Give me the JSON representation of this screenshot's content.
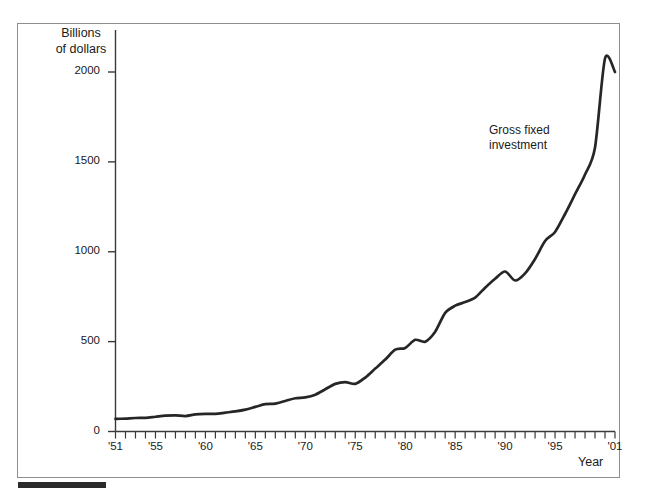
{
  "figure": {
    "ylabel": "Billions\nof dollars",
    "xlabel": "Year",
    "series_annotation": "Gross fixed\ninvestment",
    "line_color": "#262626",
    "frame_color": "#8e8e8e",
    "rule_color": "#2b2b2b"
  },
  "chart_data": {
    "type": "line",
    "title": "",
    "subtitle": "",
    "xlabel": "Year",
    "ylabel": "Billions of dollars",
    "grid": false,
    "legend_position": "inline-annotation",
    "xlim": [
      1951,
      2001
    ],
    "ylim": [
      0,
      2100
    ],
    "ytick_values": [
      0,
      500,
      1000,
      1500,
      2000
    ],
    "ytick_labels": [
      "0",
      "500",
      "1000",
      "1500",
      "2000"
    ],
    "xtick_values": [
      1951,
      1955,
      1960,
      1965,
      1970,
      1975,
      1980,
      1985,
      1990,
      1995,
      2001
    ],
    "xtick_labels": [
      "'51",
      "'55",
      "'60",
      "'65",
      "'70",
      "'75",
      "'80",
      "'85",
      "'90",
      "'95",
      "'01"
    ],
    "minor_xticks": "every year from 1951 to 2001",
    "series": [
      {
        "name": "Gross fixed investment",
        "x": [
          1951,
          1952,
          1953,
          1954,
          1955,
          1956,
          1957,
          1958,
          1959,
          1960,
          1961,
          1962,
          1963,
          1964,
          1965,
          1966,
          1967,
          1968,
          1969,
          1970,
          1971,
          1972,
          1973,
          1974,
          1975,
          1976,
          1977,
          1978,
          1979,
          1980,
          1981,
          1982,
          1983,
          1984,
          1985,
          1986,
          1987,
          1988,
          1989,
          1990,
          1991,
          1992,
          1993,
          1994,
          1995,
          1996,
          1997,
          1998,
          1999,
          2000,
          2001
        ],
        "values": [
          70,
          72,
          75,
          76,
          82,
          88,
          90,
          86,
          95,
          98,
          98,
          105,
          112,
          122,
          137,
          152,
          155,
          170,
          185,
          190,
          205,
          235,
          265,
          275,
          265,
          300,
          350,
          400,
          455,
          465,
          510,
          500,
          555,
          660,
          700,
          720,
          745,
          800,
          850,
          890,
          840,
          880,
          960,
          1060,
          1110,
          1210,
          1320,
          1430,
          1580,
          2075,
          2000
        ],
        "units": "billions of dollars",
        "annotations": [
          {
            "text": "Gross fixed investment",
            "near_x": 1991,
            "near_y": 1470
          }
        ]
      }
    ]
  }
}
